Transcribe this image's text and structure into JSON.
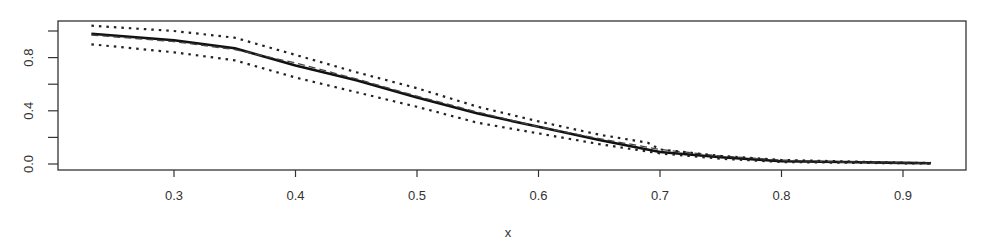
{
  "chart_data": {
    "type": "line",
    "title": "",
    "xlabel": "x",
    "ylabel": "",
    "xlim": [
      0.2,
      0.96
    ],
    "ylim": [
      -0.04,
      1.08
    ],
    "grid": false,
    "legend": null,
    "x_ticks": [
      0.3,
      0.4,
      0.5,
      0.6,
      0.7,
      0.8,
      0.9
    ],
    "x_tick_labels": [
      "0.3",
      "0.4",
      "0.5",
      "0.6",
      "0.7",
      "0.8",
      "0.9"
    ],
    "y_ticks": [
      0.0,
      0.2,
      0.4,
      0.6,
      0.8,
      1.0
    ],
    "y_tick_labels": [
      "0.0",
      "",
      "0.4",
      "",
      "0.8",
      ""
    ],
    "series": [
      {
        "name": "estimate",
        "style": "solid",
        "color": "#111111",
        "x": [
          0.232,
          0.3,
          0.35,
          0.4,
          0.45,
          0.5,
          0.55,
          0.6,
          0.65,
          0.7,
          0.75,
          0.8,
          0.85,
          0.9,
          0.923
        ],
        "y": [
          0.98,
          0.93,
          0.87,
          0.74,
          0.63,
          0.5,
          0.38,
          0.28,
          0.18,
          0.09,
          0.05,
          0.02,
          0.015,
          0.008,
          0.005
        ]
      },
      {
        "name": "true",
        "style": "dashed",
        "color": "#444444",
        "x": [
          0.232,
          0.3,
          0.35,
          0.4,
          0.45,
          0.5,
          0.55,
          0.6,
          0.65,
          0.7,
          0.75,
          0.8,
          0.85,
          0.9,
          0.923
        ],
        "y": [
          0.97,
          0.92,
          0.86,
          0.76,
          0.64,
          0.51,
          0.39,
          0.28,
          0.19,
          0.11,
          0.06,
          0.03,
          0.015,
          0.008,
          0.005
        ]
      },
      {
        "name": "upper band",
        "style": "dotted",
        "color": "#222222",
        "x": [
          0.232,
          0.3,
          0.35,
          0.4,
          0.45,
          0.5,
          0.55,
          0.6,
          0.65,
          0.69,
          0.7,
          0.75,
          0.8,
          0.85,
          0.9,
          0.923
        ],
        "y": [
          1.04,
          1.0,
          0.95,
          0.82,
          0.69,
          0.57,
          0.43,
          0.32,
          0.22,
          0.16,
          0.11,
          0.06,
          0.03,
          0.02,
          0.01,
          0.008
        ]
      },
      {
        "name": "lower band",
        "style": "dotted",
        "color": "#222222",
        "x": [
          0.232,
          0.3,
          0.35,
          0.4,
          0.45,
          0.5,
          0.55,
          0.6,
          0.65,
          0.7,
          0.75,
          0.8,
          0.85,
          0.9,
          0.923
        ],
        "y": [
          0.9,
          0.84,
          0.78,
          0.65,
          0.54,
          0.43,
          0.31,
          0.23,
          0.15,
          0.08,
          0.04,
          0.015,
          0.01,
          0.005,
          0.003
        ]
      }
    ]
  },
  "layout": {
    "plot_left": 58,
    "plot_right": 966,
    "plot_top": 21,
    "plot_bottom": 170,
    "x0_value": 0.3,
    "x0_px": 174,
    "px_per_unit_x": 1215,
    "y0_px": 164,
    "px_per_unit_y": 133
  }
}
